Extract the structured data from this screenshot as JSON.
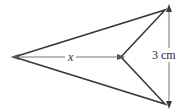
{
  "figure": {
    "type": "geometry-diagram",
    "background_color": "#ffffff",
    "stroke_color": "#3a3a3a",
    "dimension_color": "#6e6e6e",
    "shape": {
      "name": "dart-polygon",
      "vertices": [
        {
          "name": "left-apex",
          "x": 14,
          "y": 57
        },
        {
          "name": "top-right-vertex",
          "x": 165,
          "y": 10
        },
        {
          "name": "notch-vertex",
          "x": 121,
          "y": 57
        },
        {
          "name": "bottom-right-vertex",
          "x": 165,
          "y": 104
        }
      ],
      "points_attr": "14,57 165,10 121,57 165,104"
    },
    "dimensions": [
      {
        "name": "horizontal-dimension",
        "label": "x",
        "orientation": "horizontal",
        "from": {
          "x": 18,
          "y": 57
        },
        "to": {
          "x": 119,
          "y": 57
        },
        "arrowheads": "both"
      },
      {
        "name": "vertical-dimension",
        "label": "3 cm",
        "orientation": "vertical",
        "from": {
          "x": 169,
          "y": 11
        },
        "to": {
          "x": 169,
          "y": 103
        },
        "arrowheads": "both"
      }
    ]
  }
}
